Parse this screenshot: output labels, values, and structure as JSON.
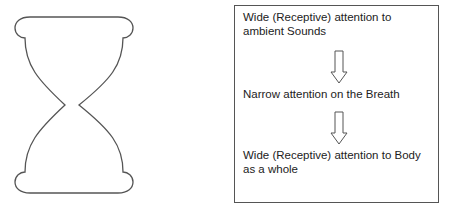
{
  "figure": {
    "left_shape": "hourglass-outline",
    "flow": {
      "steps": [
        {
          "label": "Wide (Receptive) attention to ambient Sounds"
        },
        {
          "label": "Narrow attention on the Breath"
        },
        {
          "label": "Wide (Receptive) attention to Body as a whole"
        }
      ],
      "arrows": [
        "down-arrow-icon",
        "down-arrow-icon"
      ]
    },
    "colors": {
      "stroke": "#555555",
      "text": "#222222",
      "background": "#ffffff"
    }
  }
}
